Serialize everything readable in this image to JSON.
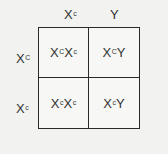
{
  "punnett_square": {
    "columns": [
      {
        "base": "X",
        "sup": "c"
      },
      {
        "base": "Y",
        "sup": ""
      }
    ],
    "rows": [
      {
        "base": "X",
        "sup": "C"
      },
      {
        "base": "X",
        "sup": "c"
      }
    ],
    "cells": [
      [
        {
          "a": "X",
          "a_sup": "C",
          "b": "X",
          "b_sup": "c"
        },
        {
          "a": "X",
          "a_sup": "C",
          "b": "Y",
          "b_sup": ""
        }
      ],
      [
        {
          "a": "X",
          "a_sup": "c",
          "b": "X",
          "b_sup": "c"
        },
        {
          "a": "X",
          "a_sup": "c",
          "b": "Y",
          "b_sup": ""
        }
      ]
    ]
  }
}
